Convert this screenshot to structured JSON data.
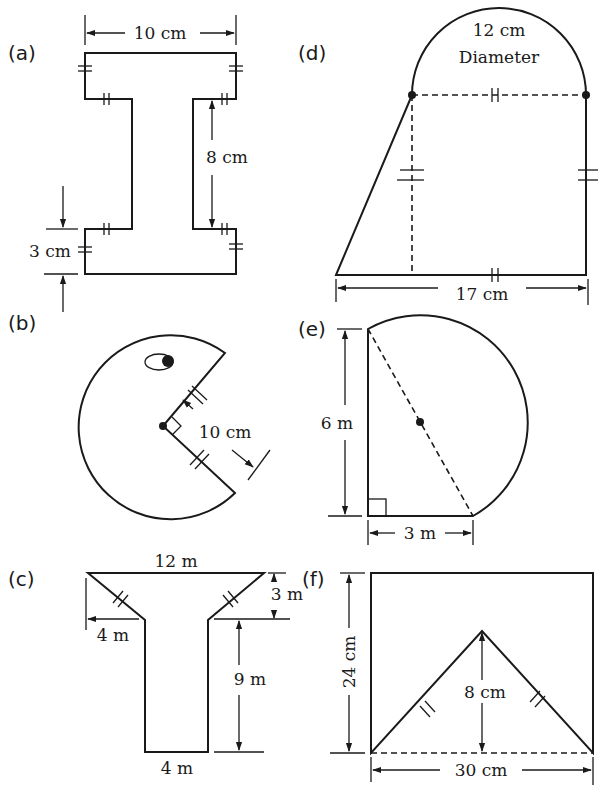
{
  "figures": [
    {
      "id": "a",
      "label": "(a)",
      "shape": "I-beam",
      "dimensions": {
        "width": "10 cm",
        "web_height": "8 cm",
        "flange_thickness": "3 cm"
      }
    },
    {
      "id": "b",
      "label": "(b)",
      "shape": "circle with right-angle sector removed (pac-man)",
      "dimensions": {
        "radius": "10 cm"
      }
    },
    {
      "id": "c",
      "label": "(c)",
      "shape": "T-shape with trapezoid top",
      "dimensions": {
        "top_width": "12 m",
        "overhang": "4 m",
        "top_height": "3 m",
        "stem_height": "9 m",
        "stem_width": "4 m"
      }
    },
    {
      "id": "d",
      "label": "(d)",
      "shape": "square with semicircle on top and triangle on left",
      "dimensions": {
        "diameter": "12 cm",
        "diameter_label": "Diameter",
        "base": "17 cm"
      }
    },
    {
      "id": "e",
      "label": "(e)",
      "shape": "right triangle with semicircle on hypotenuse",
      "dimensions": {
        "height": "6 m",
        "base": "3 m"
      }
    },
    {
      "id": "f",
      "label": "(f)",
      "shape": "rectangle with isosceles triangle removed",
      "dimensions": {
        "height": "24 cm",
        "width": "30 cm",
        "triangle_height": "8 cm"
      }
    }
  ]
}
